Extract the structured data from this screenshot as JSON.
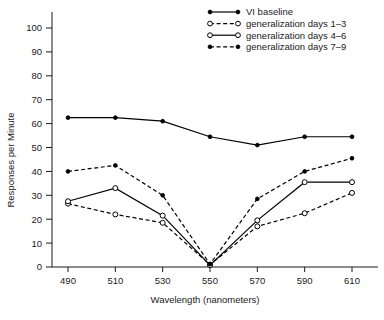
{
  "chart_data": {
    "type": "line",
    "title": "",
    "xlabel": "Wavelength (nanometers)",
    "ylabel": "Responses per Minute",
    "categories": [
      490,
      510,
      530,
      550,
      570,
      590,
      610
    ],
    "x": [
      490,
      510,
      530,
      550,
      570,
      590,
      610
    ],
    "xtick_labels": [
      "490",
      "510",
      "530",
      "550",
      "570",
      "590",
      "610"
    ],
    "ytick_labels": [
      "0",
      "10",
      "20",
      "30",
      "40",
      "50",
      "60",
      "70",
      "80",
      "90",
      "100"
    ],
    "ytick_values": [
      0,
      10,
      20,
      30,
      40,
      50,
      60,
      70,
      80,
      90,
      100
    ],
    "xlim": [
      480,
      620
    ],
    "ylim": [
      0,
      110
    ],
    "grid": false,
    "legend_position": "top-right",
    "series": [
      {
        "name": "VI baseline",
        "marker": "filled-circle",
        "linestyle": "solid",
        "values": [
          62.5,
          62.5,
          61,
          54.5,
          51,
          54.5,
          54.5
        ]
      },
      {
        "name": "generalization days 1–3",
        "marker": "open-circle",
        "linestyle": "dashed",
        "values": [
          26.5,
          22,
          18.5,
          1,
          17,
          22.5,
          31
        ]
      },
      {
        "name": "generalization days 4–6",
        "marker": "open-circle",
        "linestyle": "solid",
        "values": [
          27.5,
          33,
          21.5,
          0.8,
          19.5,
          35.5,
          35.5
        ]
      },
      {
        "name": "generalization days 7–9",
        "marker": "filled-circle",
        "linestyle": "dashed",
        "values": [
          40,
          42.5,
          30,
          1.2,
          28.5,
          40,
          45.5
        ]
      }
    ]
  },
  "legend": {
    "entries": [
      {
        "label": "VI baseline"
      },
      {
        "label": "generalization days 1–3"
      },
      {
        "label": "generalization days 4–6"
      },
      {
        "label": "generalization days 7–9"
      }
    ]
  },
  "colors": {
    "ink": "#1a1a1a",
    "line": "#000000",
    "background": "#ffffff"
  }
}
